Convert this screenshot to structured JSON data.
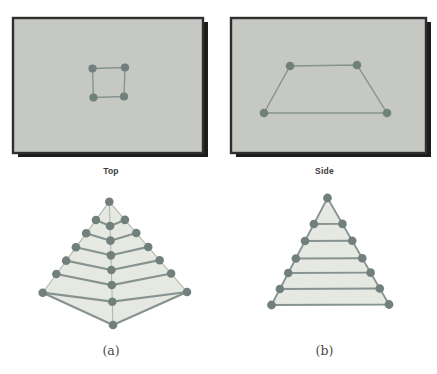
{
  "figure": {
    "panels": [
      {
        "id": "top",
        "label": "Top",
        "shape": "square",
        "vertex_count": 4
      },
      {
        "id": "side",
        "label": "Side",
        "shape": "trapezoid",
        "vertex_count": 4
      }
    ],
    "pyramids": [
      {
        "id": "a",
        "label": "(a)",
        "view": "corner",
        "levels": 6,
        "dot_count": 20
      },
      {
        "id": "b",
        "label": "(b)",
        "view": "side",
        "levels": 6,
        "dot_count": 13
      }
    ],
    "colors": {
      "background": "#ffffff",
      "panel_fill": "#c6c8c4",
      "panel_border": "#2f2f2f",
      "panel_shadow": "#1c1c1c",
      "dot": "#71807d",
      "line": "#879390",
      "light_line": "#adb5af",
      "pyramid_fill": "#e6e9e2",
      "label_color": "#3a3a3a"
    }
  }
}
